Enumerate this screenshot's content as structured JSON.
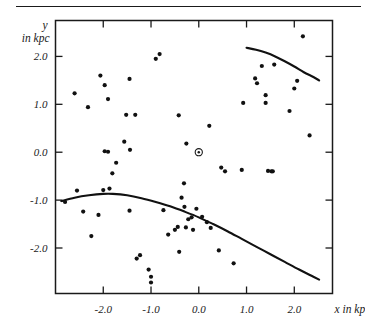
{
  "figure": {
    "name": "galactic-distribution-scatter",
    "has_top_rule": true
  },
  "chart_data": {
    "type": "scatter",
    "title": "",
    "xlabel": "x in kpc",
    "ylabel_line1": "y",
    "ylabel_line2": "in kpc",
    "xlim": [
      -3.0,
      2.8
    ],
    "ylim": [
      -2.95,
      2.75
    ],
    "xticks": [
      -2.0,
      -1.0,
      0.0,
      1.0,
      2.0
    ],
    "xticklabels": [
      "-2.0",
      "-1.0",
      "0.0",
      "1.0",
      "2.0"
    ],
    "yticks": [
      2.0,
      1.0,
      0.0,
      -1.0,
      -2.0
    ],
    "yticklabels": [
      "2.0",
      "1.0",
      "0.0",
      "-1.0",
      "-2.0"
    ],
    "grid": false,
    "legend": null,
    "frame": "box",
    "points": [
      [
        -2.6,
        1.23
      ],
      [
        -2.32,
        0.94
      ],
      [
        -2.06,
        1.6
      ],
      [
        -1.97,
        1.4
      ],
      [
        -1.9,
        1.11
      ],
      [
        -1.97,
        0.02
      ],
      [
        -1.9,
        0.01
      ],
      [
        -1.81,
        -0.44
      ],
      [
        -1.73,
        -0.22
      ],
      [
        -1.45,
        1.53
      ],
      [
        -1.52,
        0.78
      ],
      [
        -1.33,
        0.78
      ],
      [
        -1.56,
        0.22
      ],
      [
        -1.44,
        0.05
      ],
      [
        -0.9,
        1.95
      ],
      [
        -0.82,
        2.05
      ],
      [
        -0.42,
        0.77
      ],
      [
        -0.26,
        0.18
      ],
      [
        -0.31,
        -0.65
      ],
      [
        0.22,
        0.55
      ],
      [
        0.47,
        -0.32
      ],
      [
        0.55,
        -0.4
      ],
      [
        0.93,
        1.03
      ],
      [
        0.9,
        -0.37
      ],
      [
        1.18,
        1.54
      ],
      [
        1.22,
        1.44
      ],
      [
        1.32,
        1.8
      ],
      [
        1.4,
        1.19
      ],
      [
        1.4,
        1.03
      ],
      [
        1.45,
        -0.39
      ],
      [
        1.52,
        -0.4
      ],
      [
        1.55,
        -0.4
      ],
      [
        1.58,
        1.83
      ],
      [
        1.9,
        0.86
      ],
      [
        2.0,
        1.33
      ],
      [
        2.06,
        1.49
      ],
      [
        2.18,
        2.42
      ],
      [
        2.32,
        0.35
      ],
      [
        -2.8,
        -1.04
      ],
      [
        -2.55,
        -0.8
      ],
      [
        -2.42,
        -1.24
      ],
      [
        -2.25,
        -1.75
      ],
      [
        -2.1,
        -1.31
      ],
      [
        -2.0,
        -0.79
      ],
      [
        -1.87,
        -0.76
      ],
      [
        -1.45,
        -1.22
      ],
      [
        -1.3,
        -2.22
      ],
      [
        -1.23,
        -2.15
      ],
      [
        -1.05,
        -2.45
      ],
      [
        -1.0,
        -2.72
      ],
      [
        -1.0,
        -2.6
      ],
      [
        -0.74,
        -1.21
      ],
      [
        -0.64,
        -1.72
      ],
      [
        -0.5,
        -1.62
      ],
      [
        -0.44,
        -1.56
      ],
      [
        -0.41,
        -2.08
      ],
      [
        -0.36,
        -0.95
      ],
      [
        -0.3,
        -1.14
      ],
      [
        -0.27,
        -1.57
      ],
      [
        -0.22,
        -1.4
      ],
      [
        -0.15,
        -1.36
      ],
      [
        -0.12,
        -1.62
      ],
      [
        -0.05,
        -1.18
      ],
      [
        0.07,
        -1.35
      ],
      [
        0.17,
        -1.46
      ],
      [
        0.25,
        -1.58
      ],
      [
        0.42,
        -2.05
      ],
      [
        0.73,
        -2.32
      ]
    ],
    "sun_marker": {
      "label": "sun-symbol",
      "x": 0.0,
      "y": 0.0,
      "glyph": "circled-dot"
    },
    "curves": [
      {
        "name": "upper-boundary-curve",
        "points": [
          [
            1.0,
            2.18
          ],
          [
            1.2,
            2.14
          ],
          [
            1.4,
            2.08
          ],
          [
            1.6,
            2.0
          ],
          [
            1.8,
            1.9
          ],
          [
            2.0,
            1.79
          ],
          [
            2.2,
            1.67
          ],
          [
            2.4,
            1.57
          ],
          [
            2.52,
            1.5
          ]
        ]
      },
      {
        "name": "lower-boundary-curve",
        "points": [
          [
            -2.88,
            -1.02
          ],
          [
            -2.6,
            -0.95
          ],
          [
            -2.3,
            -0.9
          ],
          [
            -2.0,
            -0.87
          ],
          [
            -1.8,
            -0.87
          ],
          [
            -1.5,
            -0.9
          ],
          [
            -1.2,
            -0.96
          ],
          [
            -0.9,
            -1.04
          ],
          [
            -0.6,
            -1.13
          ],
          [
            -0.3,
            -1.24
          ],
          [
            0.0,
            -1.36
          ],
          [
            0.3,
            -1.5
          ],
          [
            0.6,
            -1.65
          ],
          [
            0.9,
            -1.81
          ],
          [
            1.2,
            -1.97
          ],
          [
            1.5,
            -2.13
          ],
          [
            1.8,
            -2.29
          ],
          [
            2.1,
            -2.45
          ],
          [
            2.4,
            -2.6
          ],
          [
            2.52,
            -2.66
          ]
        ]
      }
    ]
  }
}
